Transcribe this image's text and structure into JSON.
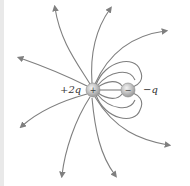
{
  "diagram": {
    "charges": [
      {
        "label": "+2q",
        "sign": "+",
        "x": 93,
        "y": 90,
        "r": 7
      },
      {
        "label": "−q",
        "sign": "−",
        "x": 128,
        "y": 90,
        "r": 7
      }
    ],
    "colors": {
      "line": "#7f7f7f",
      "charge": "#bdbdbd",
      "label": "#333333"
    }
  }
}
